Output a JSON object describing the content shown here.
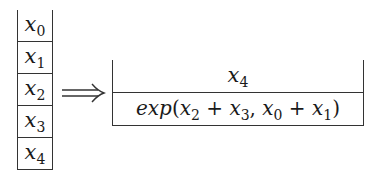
{
  "diagram": {
    "left_stack": {
      "cells": [
        {
          "base": "x",
          "sub": "0"
        },
        {
          "base": "x",
          "sub": "1"
        },
        {
          "base": "x",
          "sub": "2"
        },
        {
          "base": "x",
          "sub": "3"
        },
        {
          "base": "x",
          "sub": "4"
        }
      ]
    },
    "arrow": "⟹",
    "right_stack": {
      "top": {
        "base": "x",
        "sub": "4"
      },
      "bottom": {
        "func": "exp",
        "open": "(",
        "a": {
          "base": "x",
          "sub": "2"
        },
        "plus1": " + ",
        "b": {
          "base": "x",
          "sub": "3"
        },
        "comma": ", ",
        "c": {
          "base": "x",
          "sub": "0"
        },
        "plus2": " + ",
        "d": {
          "base": "x",
          "sub": "1"
        },
        "close": ")"
      }
    }
  }
}
